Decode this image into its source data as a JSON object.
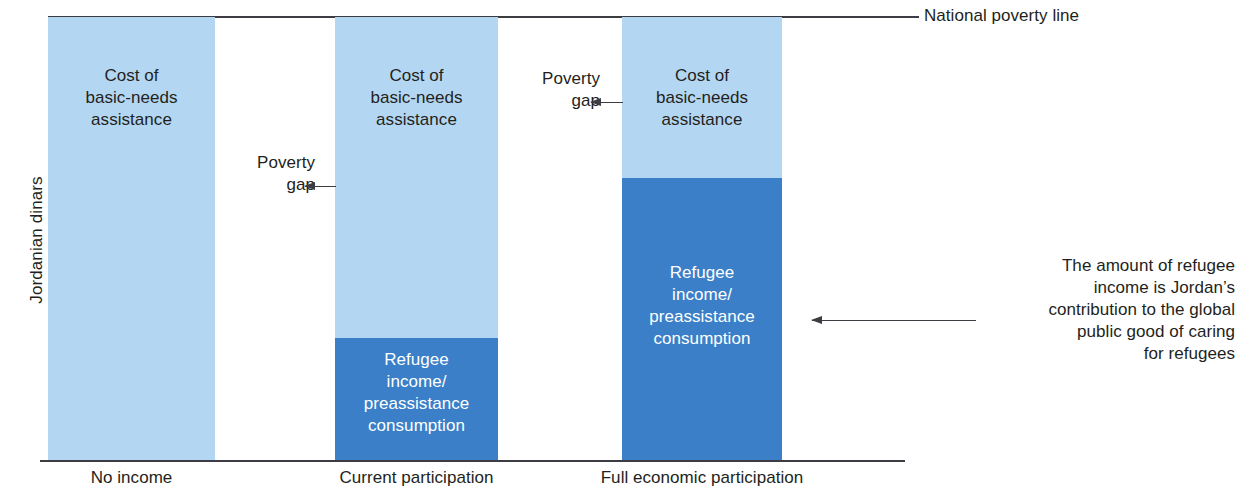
{
  "chart_data": {
    "type": "bar",
    "title": "",
    "subtitle": "",
    "xlabel": "",
    "ylabel": "Jordanian dinars",
    "grid": false,
    "legend": "none",
    "stacked": true,
    "ylim": [
      0,
      100
    ],
    "reference_line": {
      "label": "National poverty line",
      "value": 100
    },
    "categories": [
      "No income",
      "Current participation",
      "Full economic participation"
    ],
    "series": [
      {
        "name": "Refugee income/preassistance consumption",
        "color": "#3a7fc8",
        "values": [
          0,
          28,
          64
        ]
      },
      {
        "name": "Cost of basic-needs assistance",
        "color": "#b3d7f2",
        "values": [
          100,
          72,
          36
        ]
      }
    ],
    "annotations": [
      {
        "name": "poverty-gap-current",
        "text": "Poverty gap",
        "points_to": "Current participation"
      },
      {
        "name": "poverty-gap-full",
        "text": "Poverty gap",
        "points_to": "Full economic participation"
      },
      {
        "name": "refugee-income-note",
        "text": "The amount of refugee income is Jordan's contribution to the global public good of caring for refugees",
        "points_to": "Full economic participation"
      }
    ]
  },
  "axes": {
    "ylabel": "Jordanian dinars"
  },
  "poverty_line": {
    "label": "National poverty line"
  },
  "bars": [
    {
      "tick_label": "No income",
      "light_label_lines": [
        "Cost of",
        "basic-needs",
        "assistance"
      ],
      "dark_label_lines": []
    },
    {
      "tick_label": "Current participation",
      "light_label_lines": [
        "Cost of",
        "basic-needs",
        "assistance"
      ],
      "dark_label_lines": [
        "Refugee",
        "income/",
        "preassistance",
        "consumption"
      ]
    },
    {
      "tick_label": "Full economic participation",
      "light_label_lines": [
        "Cost of",
        "basic-needs",
        "assistance"
      ],
      "dark_label_lines": [
        "Refugee",
        "income/",
        "preassistance",
        "consumption"
      ]
    }
  ],
  "annotations": {
    "poverty_gap_1_lines": [
      "Poverty",
      "gap"
    ],
    "poverty_gap_2_lines": [
      "Poverty",
      "gap"
    ],
    "note_lines": [
      "The amount of refugee",
      "income is Jordan’s",
      "contribution to the global",
      "public good of caring",
      "for refugees"
    ]
  },
  "colors": {
    "light_blue": "#b3d7f2",
    "dark_blue": "#3a7fc8",
    "line": "#3c3c42",
    "text": "#231f20"
  }
}
